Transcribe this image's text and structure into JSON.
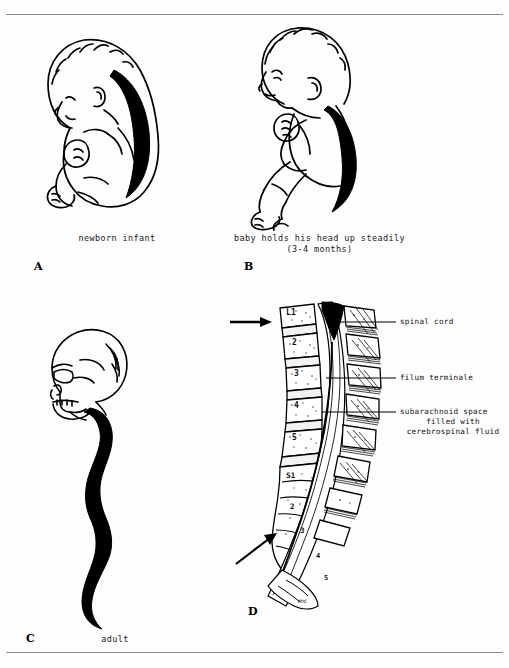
{
  "figure": {
    "title_present": false,
    "background_color": "#fdfdfd",
    "ink_color": "#000000",
    "border_rule_color": "#8a8a8a"
  },
  "panels": [
    {
      "letter": "A",
      "name": "newborn-infant",
      "caption": "newborn infant",
      "description": "fetal-position newborn in profile with thick black spinal cord curving along the back"
    },
    {
      "letter": "B",
      "name": "infant-head-control",
      "caption_line1": "baby holds his head up steadily",
      "caption_line2": "(3-4 months)",
      "description": "seated infant in profile with thick black spinal cord curving along the back"
    },
    {
      "letter": "C",
      "name": "adult",
      "caption": "adult",
      "description": "adult skull in profile with long wavy black spinal cord descending"
    },
    {
      "letter": "D",
      "name": "lumbosacral-section",
      "description": "midsagittal section of lumbar and sacral vertebral column showing spinal cord termination",
      "vertebra_labels": [
        "L1",
        "2",
        "3",
        "4",
        "5",
        "S1",
        "2",
        "3",
        "4",
        "5"
      ],
      "annotations": [
        {
          "text": "spinal cord",
          "name": "spinal-cord-label"
        },
        {
          "text": "filum terminale",
          "name": "filum-terminale-label"
        },
        {
          "text": "subarachnoid space",
          "name": "subarachnoid-space-label-line1"
        },
        {
          "text": "filled with",
          "name": "subarachnoid-space-label-line2"
        },
        {
          "text": "cerebrospinal fluid",
          "name": "subarachnoid-space-label-line3"
        }
      ],
      "arrows": [
        {
          "name": "upper-arrow",
          "points_to": "L1 vertebra",
          "direction": "right"
        },
        {
          "name": "lower-arrow",
          "points_to": "S3 sacral level",
          "direction": "up-right"
        }
      ],
      "signature": "mc"
    }
  ]
}
